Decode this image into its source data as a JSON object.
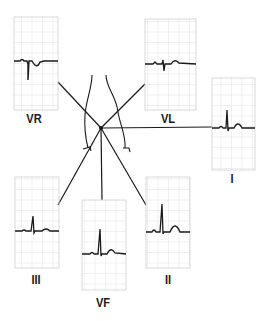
{
  "diagram": {
    "center": {
      "x": 101,
      "y": 128
    },
    "colors": {
      "line": "#1a1a1a",
      "grid": "#d8d8d8",
      "grid_border": "#c8c8c8",
      "trace": "#1a1a1a",
      "background": "#ffffff"
    },
    "leads": [
      {
        "id": "VR",
        "label": "VR"
      },
      {
        "id": "VL",
        "label": "VL"
      },
      {
        "id": "I",
        "label": "I"
      },
      {
        "id": "III",
        "label": "III"
      },
      {
        "id": "VF",
        "label": "VF"
      },
      {
        "id": "II",
        "label": "II"
      }
    ]
  }
}
